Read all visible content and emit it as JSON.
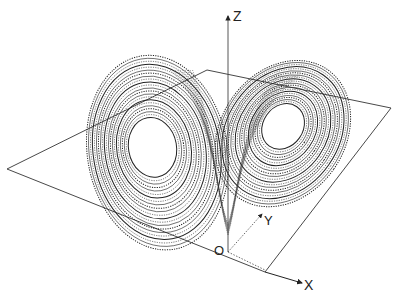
{
  "diagram": {
    "axes": {
      "z_label": "Z",
      "y_label": "Y",
      "x_label": "X",
      "origin_label": "O"
    },
    "plane": {
      "corners": [
        [
          207,
          70
        ],
        [
          391,
          108
        ],
        [
          265,
          272
        ],
        [
          7,
          169
        ]
      ]
    },
    "lobes": [
      {
        "name": "left-lobe",
        "cx": 155,
        "cy": 150,
        "rx_min": 24,
        "rx_max": 70,
        "ry_min": 30,
        "ry_max": 98,
        "rings": 22,
        "rotate": -10
      },
      {
        "name": "right-lobe",
        "cx": 283,
        "cy": 130,
        "rx_min": 20,
        "rx_max": 62,
        "ry_min": 24,
        "ry_max": 78,
        "rings": 22,
        "rotate": 35
      }
    ],
    "colors": {
      "stroke": "#222222",
      "background": "#ffffff"
    }
  }
}
